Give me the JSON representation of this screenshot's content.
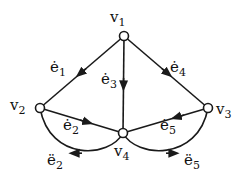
{
  "diagram": {
    "type": "directed-graph",
    "colors": {
      "stroke": "#1a1a1a",
      "node_fill": "#ffffff",
      "background": "#ffffff"
    },
    "nodes": [
      {
        "id": "v1",
        "label": "v",
        "sub": "1",
        "x": 124,
        "y": 36
      },
      {
        "id": "v2",
        "label": "v",
        "sub": "2",
        "x": 40,
        "y": 108
      },
      {
        "id": "v3",
        "label": "v",
        "sub": "3",
        "x": 208,
        "y": 108
      },
      {
        "id": "v4",
        "label": "v",
        "sub": "4",
        "x": 123,
        "y": 133
      }
    ],
    "edges": [
      {
        "id": "e1_dot",
        "from": "v1",
        "to": "v2",
        "label": "ė",
        "sub": "1",
        "style": "straight"
      },
      {
        "id": "e3_dot",
        "from": "v1",
        "to": "v4",
        "label": "ė",
        "sub": "3",
        "style": "straight"
      },
      {
        "id": "e4_dot",
        "from": "v1",
        "to": "v3",
        "label": "ė",
        "sub": "4",
        "style": "straight"
      },
      {
        "id": "e2_dot",
        "from": "v2",
        "to": "v4",
        "label": "ė",
        "sub": "2",
        "style": "straight"
      },
      {
        "id": "e5_dot",
        "from": "v3",
        "to": "v4",
        "label": "ė",
        "sub": "5",
        "style": "straight"
      },
      {
        "id": "e2_ddot",
        "from": "v4",
        "to": "v2",
        "label": "ë",
        "sub": "2",
        "style": "curved-below"
      },
      {
        "id": "e5_ddot",
        "from": "v4",
        "to": "v3",
        "label": "ë",
        "sub": "5",
        "style": "curved-below"
      }
    ]
  }
}
